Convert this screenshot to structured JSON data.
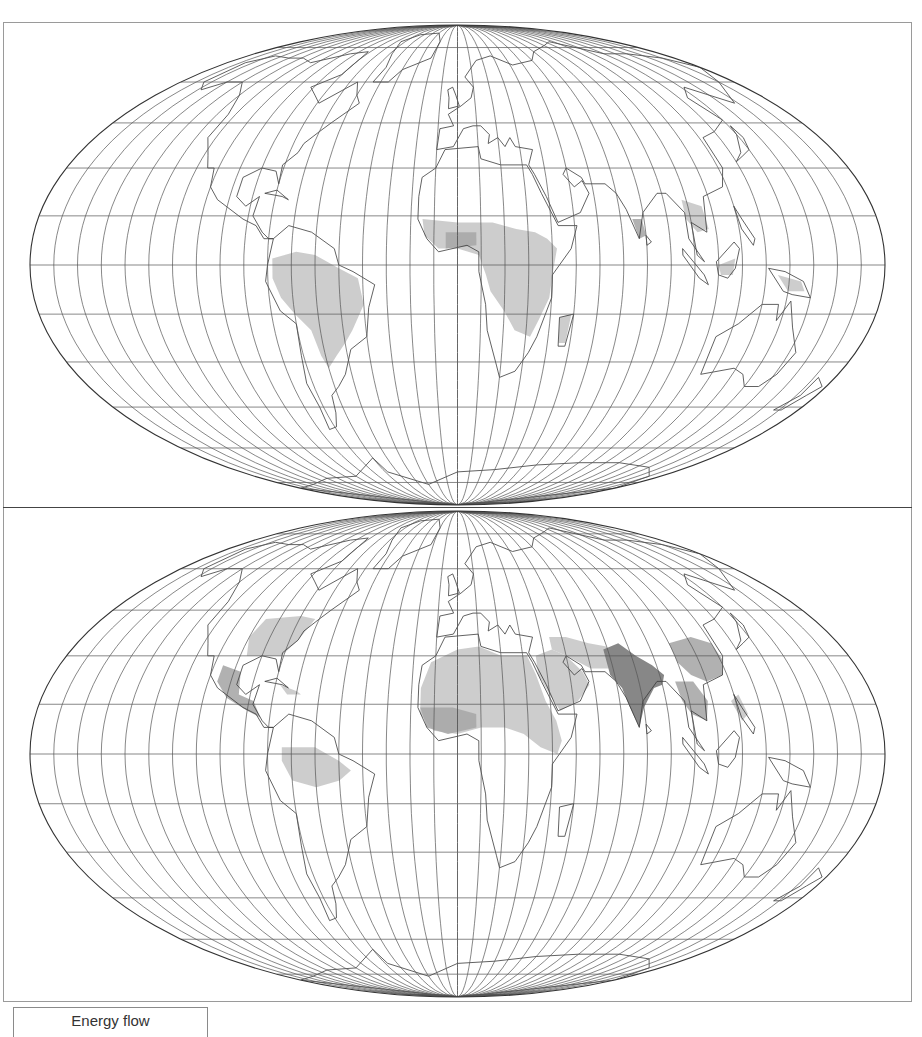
{
  "figure": {
    "projection": "Mollweide (equal-area, pseudocylindrical)",
    "graticule": {
      "meridian_spacing_deg": 10,
      "parallel_spacing_deg": 15
    },
    "colors": {
      "background": "#ffffff",
      "outline": "#3a3a3a",
      "graticule": "#555555",
      "shade_light": "#c8c8c8",
      "shade_mid": "#a8a8a8",
      "shade_dark": "#7a7a7a",
      "frame": "#9a9a9a"
    }
  },
  "panels": [
    {
      "id": "top",
      "shaded_regions": [
        "West Africa",
        "Central Africa",
        "East Africa",
        "Madagascar",
        "Amazon Basin",
        "Southern Brazil / Paraguay",
        "Southern India",
        "Southeast Asia",
        "Borneo",
        "New Guinea"
      ]
    },
    {
      "id": "bottom",
      "shaded_regions": [
        "Eastern United States",
        "Mexico / Central America",
        "Caribbean",
        "Sahara / North Africa",
        "West Africa",
        "East Africa",
        "Arabian Peninsula",
        "Middle East",
        "Indian subcontinent",
        "Eastern China",
        "Southeast Asia",
        "Amazon Basin"
      ]
    }
  ],
  "legend": {
    "title": "Energy flow"
  }
}
